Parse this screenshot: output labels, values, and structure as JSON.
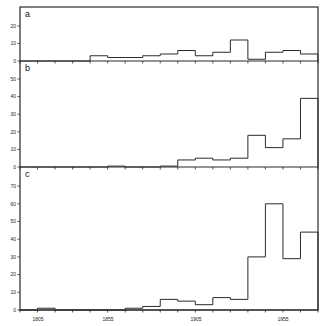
{
  "chart_data": [
    {
      "type": "bar",
      "panel": "a",
      "title": "a",
      "bin_width_years": 10,
      "categories": [
        "1795",
        "1805",
        "1815",
        "1825",
        "1835",
        "1845",
        "1855",
        "1865",
        "1875",
        "1885",
        "1895",
        "1905",
        "1915",
        "1925",
        "1935",
        "1945",
        "1955"
      ],
      "values": [
        0,
        0,
        0,
        0,
        3,
        2,
        2,
        3,
        4,
        6,
        3,
        5,
        12,
        1,
        5,
        6,
        4
      ],
      "yticks": [
        0,
        10,
        20
      ],
      "ylim": [
        0,
        30
      ],
      "xlabel": "",
      "ylabel": "",
      "grid": false
    },
    {
      "type": "bar",
      "panel": "b",
      "title": "b",
      "bin_width_years": 10,
      "categories": [
        "1795",
        "1805",
        "1815",
        "1825",
        "1835",
        "1845",
        "1855",
        "1865",
        "1875",
        "1885",
        "1895",
        "1905",
        "1915",
        "1925",
        "1935",
        "1945",
        "1955"
      ],
      "values": [
        0,
        0,
        0,
        0,
        0,
        0.5,
        0,
        0,
        0.5,
        4,
        5,
        4,
        5,
        18,
        11,
        16,
        39
      ],
      "yticks": [
        0,
        10,
        20,
        30,
        40,
        50
      ],
      "ylim": [
        0,
        55
      ],
      "xlabel": "",
      "ylabel": "",
      "grid": false
    },
    {
      "type": "bar",
      "panel": "c",
      "title": "c",
      "bin_width_years": 10,
      "categories": [
        "1795",
        "1805",
        "1815",
        "1825",
        "1835",
        "1845",
        "1855",
        "1865",
        "1875",
        "1885",
        "1895",
        "1905",
        "1915",
        "1925",
        "1935",
        "1945",
        "1955"
      ],
      "values": [
        0,
        1,
        0,
        0,
        0,
        0,
        1,
        2,
        6,
        5,
        3,
        7,
        6,
        30,
        60,
        29,
        44
      ],
      "yticks": [
        0,
        10,
        20,
        30,
        40,
        50,
        60,
        70
      ],
      "ylim": [
        0,
        75
      ],
      "xlabel": "",
      "ylabel": "",
      "grid": false
    }
  ],
  "x_axis": {
    "tick_labels": [
      {
        "label": "1805",
        "x": 38
      },
      {
        "label": "1855",
        "x": 108
      },
      {
        "label": "1905",
        "x": 196
      },
      {
        "label": "1955",
        "x": 283
      }
    ]
  },
  "panel_letters": [
    "a",
    "b",
    "c"
  ],
  "colors": {
    "line": "#2a2a2a",
    "background": "#ffffff"
  }
}
